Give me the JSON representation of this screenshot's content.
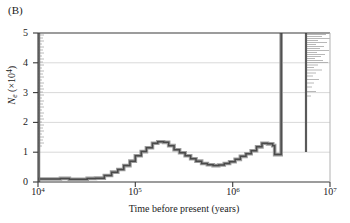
{
  "panel": {
    "label": "(B)"
  },
  "chart_data": {
    "type": "line",
    "title": "",
    "subtitle": "",
    "xlabel": "Time before present (years)",
    "ylabel": "Ne (×10⁴)",
    "ylabel_parts": {
      "symbol": "N",
      "subscript": "e",
      "units_open": " (×10",
      "exponent": "4",
      "units_close": ")"
    },
    "x_scale": "log10",
    "y_scale": "linear",
    "xlim": [
      10000,
      10000000
    ],
    "ylim": [
      0,
      5
    ],
    "grid": "horizontal",
    "legend": "none",
    "xticks": [
      {
        "value": 10000,
        "label": "10",
        "exponent": "4"
      },
      {
        "value": 100000,
        "label": "10",
        "exponent": "5"
      },
      {
        "value": 1000000,
        "label": "10",
        "exponent": "6"
      },
      {
        "value": 10000000,
        "label": "10",
        "exponent": "7"
      }
    ],
    "yticks": [
      {
        "value": 0,
        "label": "0"
      },
      {
        "value": 1,
        "label": "1"
      },
      {
        "value": 2,
        "label": "2"
      },
      {
        "value": 3,
        "label": "3"
      },
      {
        "value": 4,
        "label": "4"
      },
      {
        "value": 5,
        "label": "5"
      }
    ],
    "series": [
      {
        "name": "Effective population size (PSMC estimate)",
        "style": "step",
        "color": "#4a4a4a",
        "band_color": "#9a9a9a",
        "points": [
          {
            "x": 10000,
            "y": 0.1
          },
          {
            "x": 13000,
            "y": 0.1
          },
          {
            "x": 17000,
            "y": 0.12
          },
          {
            "x": 21000,
            "y": 0.09
          },
          {
            "x": 26000,
            "y": 0.09
          },
          {
            "x": 32000,
            "y": 0.12
          },
          {
            "x": 39000,
            "y": 0.13
          },
          {
            "x": 48000,
            "y": 0.22
          },
          {
            "x": 57000,
            "y": 0.33
          },
          {
            "x": 66000,
            "y": 0.42
          },
          {
            "x": 76000,
            "y": 0.55
          },
          {
            "x": 88000,
            "y": 0.7
          },
          {
            "x": 100000,
            "y": 0.88
          },
          {
            "x": 115000,
            "y": 1.02
          },
          {
            "x": 130000,
            "y": 1.15
          },
          {
            "x": 150000,
            "y": 1.3
          },
          {
            "x": 170000,
            "y": 1.35
          },
          {
            "x": 195000,
            "y": 1.33
          },
          {
            "x": 220000,
            "y": 1.22
          },
          {
            "x": 250000,
            "y": 1.08
          },
          {
            "x": 285000,
            "y": 0.98
          },
          {
            "x": 325000,
            "y": 0.88
          },
          {
            "x": 370000,
            "y": 0.78
          },
          {
            "x": 420000,
            "y": 0.7
          },
          {
            "x": 480000,
            "y": 0.62
          },
          {
            "x": 550000,
            "y": 0.58
          },
          {
            "x": 630000,
            "y": 0.55
          },
          {
            "x": 720000,
            "y": 0.57
          },
          {
            "x": 820000,
            "y": 0.62
          },
          {
            "x": 930000,
            "y": 0.68
          },
          {
            "x": 1060000,
            "y": 0.76
          },
          {
            "x": 1200000,
            "y": 0.86
          },
          {
            "x": 1370000,
            "y": 0.95
          },
          {
            "x": 1550000,
            "y": 1.05
          },
          {
            "x": 1760000,
            "y": 1.18
          },
          {
            "x": 2000000,
            "y": 1.3
          },
          {
            "x": 2280000,
            "y": 1.28
          },
          {
            "x": 2580000,
            "y": 1.22
          },
          {
            "x": 2700000,
            "y": 0.92
          },
          {
            "x": 3100000,
            "y": 0.92
          },
          {
            "x": 3150000,
            "y": 5.0
          }
        ]
      }
    ],
    "annotations": [
      {
        "name": "recent-bootstrap-spike",
        "x": 10000,
        "y_from": 1.15,
        "y_to": 5.0,
        "description": "Vertical bundle of bootstrap replicate trajectories at the recent time boundary"
      },
      {
        "name": "ancient-bootstrap-spike",
        "x": 3150000,
        "y_from": 0.92,
        "y_to": 5.0,
        "description": "Vertical bundle of bootstrap replicate trajectories at the ancient time boundary with horizontal fans to the right"
      }
    ],
    "colors": {
      "line": "#4a4a4a",
      "band": "#9a9a9a",
      "grid": "#c9c9c9",
      "axis": "#3a3a3a",
      "background": "#ffffff",
      "text": "#222222"
    }
  }
}
